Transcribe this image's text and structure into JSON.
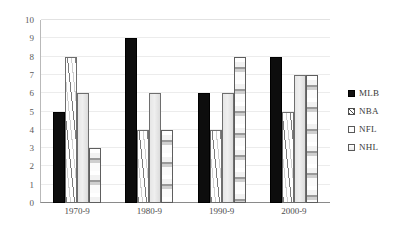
{
  "chart_data": {
    "type": "bar",
    "title": "",
    "xlabel": "",
    "ylabel": "",
    "categories": [
      "1970-9",
      "1980-9",
      "1990-9",
      "2000-9"
    ],
    "series": [
      {
        "name": "MLB",
        "values": [
          5,
          9,
          6,
          8
        ],
        "fill": "solid-black",
        "color": "#0d0d0d"
      },
      {
        "name": "NBA",
        "values": [
          8,
          4,
          4,
          5
        ],
        "fill": "diagonal-hatch",
        "color": "#7d7d7d"
      },
      {
        "name": "NFL",
        "values": [
          6,
          6,
          6,
          7
        ],
        "fill": "light-gray",
        "color": "#e6e6e6"
      },
      {
        "name": "NHL",
        "values": [
          3,
          4,
          8,
          7
        ],
        "fill": "horizontal-bands",
        "color": "#cfcfcf"
      }
    ],
    "ylim": [
      0,
      10
    ],
    "yticks": [
      10,
      9,
      8,
      7,
      6,
      5,
      4,
      3,
      2,
      1,
      0
    ],
    "grid": true,
    "legend_position": "right"
  },
  "legend": {
    "items": [
      {
        "label": "MLB"
      },
      {
        "label": "NBA"
      },
      {
        "label": "NFL"
      },
      {
        "label": "NHL"
      }
    ]
  }
}
